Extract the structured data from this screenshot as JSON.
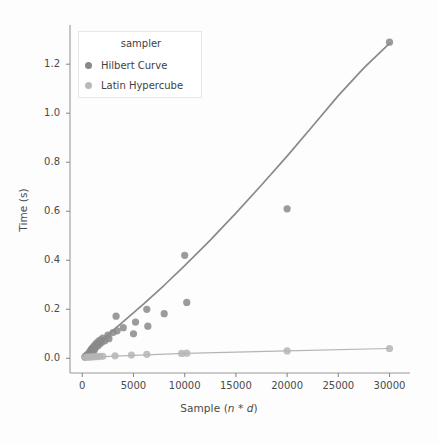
{
  "chart_data": {
    "type": "scatter",
    "title": "",
    "xlabel": "Sample (n * d)",
    "ylabel": "Time (s)",
    "xlim": [
      -1200,
      32000
    ],
    "ylim": [
      -0.06,
      1.36
    ],
    "xticks": [
      0,
      5000,
      10000,
      15000,
      20000,
      25000,
      30000
    ],
    "xtick_labels": [
      "0",
      "5000",
      "10000",
      "15000",
      "20000",
      "25000",
      "30000"
    ],
    "yticks": [
      0.0,
      0.2,
      0.4,
      0.6,
      0.8,
      1.0,
      1.2
    ],
    "ytick_labels": [
      "0.0",
      "0.2",
      "0.4",
      "0.6",
      "0.8",
      "1.0",
      "1.2"
    ],
    "grid": false,
    "legend": {
      "title": "sampler",
      "position": "upper-left",
      "entries": [
        {
          "label": "Hilbert Curve",
          "color": "#888888"
        },
        {
          "label": "Latin Hypercube",
          "color": "#b9b9b9"
        }
      ]
    },
    "series": [
      {
        "name": "Hilbert Curve",
        "color": "#8a8a8a",
        "marker": "o",
        "points": [
          [
            250,
            0.005
          ],
          [
            300,
            0.008
          ],
          [
            400,
            0.01
          ],
          [
            450,
            0.012
          ],
          [
            500,
            0.015
          ],
          [
            600,
            0.018
          ],
          [
            650,
            0.012
          ],
          [
            700,
            0.022
          ],
          [
            750,
            0.028
          ],
          [
            800,
            0.02
          ],
          [
            850,
            0.032
          ],
          [
            900,
            0.038
          ],
          [
            950,
            0.025
          ],
          [
            1000,
            0.042
          ],
          [
            1050,
            0.03
          ],
          [
            1100,
            0.048
          ],
          [
            1200,
            0.035
          ],
          [
            1250,
            0.055
          ],
          [
            1300,
            0.045
          ],
          [
            1400,
            0.062
          ],
          [
            1500,
            0.05
          ],
          [
            1600,
            0.07
          ],
          [
            1700,
            0.058
          ],
          [
            1800,
            0.075
          ],
          [
            1900,
            0.065
          ],
          [
            2000,
            0.082
          ],
          [
            2200,
            0.072
          ],
          [
            2500,
            0.095
          ],
          [
            2600,
            0.08
          ],
          [
            3000,
            0.105
          ],
          [
            3300,
            0.172
          ],
          [
            3400,
            0.112
          ],
          [
            4000,
            0.125
          ],
          [
            5000,
            0.1
          ],
          [
            5200,
            0.148
          ],
          [
            6300,
            0.2
          ],
          [
            6400,
            0.131
          ],
          [
            8000,
            0.182
          ],
          [
            10000,
            0.42
          ],
          [
            10200,
            0.228
          ],
          [
            20000,
            0.61
          ],
          [
            30000,
            1.29
          ]
        ],
        "trend": [
          [
            250,
            0.012
          ],
          [
            2000,
            0.078
          ],
          [
            4000,
            0.15
          ],
          [
            6000,
            0.222
          ],
          [
            8000,
            0.298
          ],
          [
            10000,
            0.378
          ],
          [
            12500,
            0.482
          ],
          [
            15000,
            0.592
          ],
          [
            17500,
            0.707
          ],
          [
            20000,
            0.825
          ],
          [
            22500,
            0.948
          ],
          [
            25000,
            1.072
          ],
          [
            27500,
            1.185
          ],
          [
            30000,
            1.285
          ]
        ]
      },
      {
        "name": "Latin Hypercube",
        "color": "#b5b5b5",
        "marker": "o",
        "points": [
          [
            300,
            0.004
          ],
          [
            500,
            0.005
          ],
          [
            700,
            0.005
          ],
          [
            900,
            0.006
          ],
          [
            1100,
            0.006
          ],
          [
            1300,
            0.007
          ],
          [
            1500,
            0.007
          ],
          [
            1700,
            0.008
          ],
          [
            2000,
            0.008
          ],
          [
            3200,
            0.01
          ],
          [
            4800,
            0.013
          ],
          [
            6300,
            0.016
          ],
          [
            9700,
            0.02
          ],
          [
            10200,
            0.021
          ],
          [
            20000,
            0.03
          ],
          [
            30000,
            0.04
          ]
        ],
        "trend": [
          [
            300,
            0.004
          ],
          [
            5000,
            0.012
          ],
          [
            10000,
            0.02
          ],
          [
            20000,
            0.03
          ],
          [
            30000,
            0.04
          ]
        ]
      }
    ]
  },
  "axes": {
    "spine_color": "#9a9a9a",
    "tick_color": "#8c8c8c",
    "text_color": "#4a4a4a"
  }
}
